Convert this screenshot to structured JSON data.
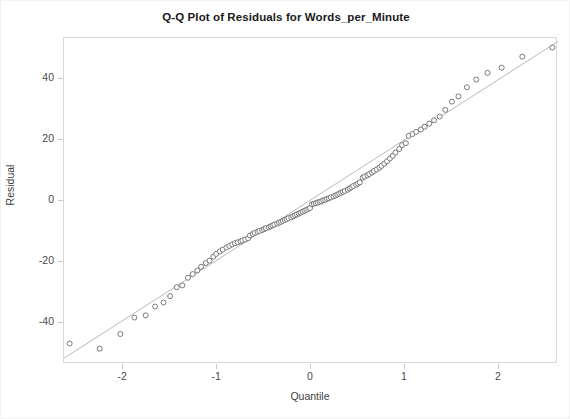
{
  "chart_data": {
    "type": "scatter",
    "title": "Q-Q Plot of Residuals for Words_per_Minute",
    "xlabel": "Quantile",
    "ylabel": "Residual",
    "xlim": [
      -2.63,
      2.63
    ],
    "ylim": [
      -53.3,
      53.3
    ],
    "grid": false,
    "legend": null,
    "xticks": [
      -2,
      -1,
      0,
      1,
      2
    ],
    "xtick_labels": [
      "-2",
      "-1",
      "0",
      "1",
      "2"
    ],
    "yticks": [
      40,
      20,
      0,
      -20,
      -40
    ],
    "ytick_labels": [
      "40",
      "20",
      "0",
      "-20",
      "-40"
    ],
    "marker": "open-circle",
    "marker_color": "#6b6b6b",
    "marker_fill": "#ffffff",
    "marker_size": 5,
    "reference_line": {
      "name": "normal-reference-line",
      "color": "#b0b0b0",
      "slope": 19.7,
      "intercept": 0.4,
      "x_start": -2.63,
      "x_end": 2.63,
      "y_start": -51.4,
      "y_end": 52.2
    },
    "series": [
      {
        "name": "Residual quantiles",
        "x": [
          -2.57,
          -2.25,
          -2.03,
          -1.88,
          -1.76,
          -1.66,
          -1.57,
          -1.5,
          -1.43,
          -1.37,
          -1.31,
          -1.26,
          -1.21,
          -1.17,
          -1.12,
          -1.08,
          -1.04,
          -1.01,
          -0.97,
          -0.94,
          -0.9,
          -0.87,
          -0.84,
          -0.81,
          -0.78,
          -0.75,
          -0.73,
          -0.7,
          -0.67,
          -0.65,
          -0.62,
          -0.6,
          -0.57,
          -0.55,
          -0.52,
          -0.5,
          -0.48,
          -0.45,
          -0.43,
          -0.41,
          -0.39,
          -0.36,
          -0.34,
          -0.32,
          -0.3,
          -0.28,
          -0.26,
          -0.24,
          -0.21,
          -0.19,
          -0.17,
          -0.15,
          -0.13,
          -0.11,
          -0.09,
          -0.07,
          -0.05,
          -0.03,
          -0.01,
          0.01,
          0.03,
          0.05,
          0.07,
          0.09,
          0.11,
          0.13,
          0.15,
          0.17,
          0.19,
          0.21,
          0.24,
          0.26,
          0.28,
          0.3,
          0.32,
          0.34,
          0.36,
          0.39,
          0.41,
          0.43,
          0.45,
          0.48,
          0.5,
          0.52,
          0.55,
          0.57,
          0.6,
          0.62,
          0.65,
          0.67,
          0.7,
          0.73,
          0.75,
          0.78,
          0.81,
          0.84,
          0.87,
          0.9,
          0.94,
          0.97,
          1.01,
          1.04,
          1.08,
          1.12,
          1.17,
          1.21,
          1.26,
          1.31,
          1.37,
          1.43,
          1.5,
          1.57,
          1.66,
          1.76,
          1.88,
          2.03,
          2.25,
          2.57
        ],
        "y": [
          -46.6,
          -48.3,
          -43.5,
          -38.1,
          -37.4,
          -34.5,
          -33.2,
          -31.1,
          -28.2,
          -27.6,
          -25.1,
          -23.9,
          -22.7,
          -21.5,
          -20.3,
          -19.5,
          -18.2,
          -17.3,
          -16.5,
          -15.9,
          -15.2,
          -14.7,
          -14.2,
          -13.8,
          -13.5,
          -13.2,
          -12.9,
          -12.6,
          -12.2,
          -11.3,
          -10.8,
          -10.4,
          -10.1,
          -9.8,
          -9.5,
          -9.2,
          -8.9,
          -8.6,
          -8.3,
          -8.0,
          -7.7,
          -7.4,
          -7.1,
          -6.8,
          -6.5,
          -6.2,
          -5.9,
          -5.6,
          -5.3,
          -5.0,
          -4.7,
          -4.4,
          -4.1,
          -3.8,
          -3.5,
          -3.2,
          -2.9,
          -2.6,
          -2.3,
          -1.1,
          -0.9,
          -0.7,
          -0.5,
          -0.3,
          -0.1,
          0.2,
          0.4,
          0.7,
          0.9,
          1.2,
          1.5,
          1.8,
          2.1,
          2.4,
          2.7,
          3.0,
          3.3,
          3.7,
          4.1,
          4.5,
          4.9,
          5.3,
          5.7,
          6.1,
          7.6,
          8.0,
          8.4,
          8.8,
          9.3,
          9.8,
          10.3,
          10.9,
          11.5,
          12.2,
          13.0,
          13.9,
          14.8,
          15.8,
          17.0,
          18.3,
          18.9,
          21.3,
          21.9,
          22.6,
          23.4,
          24.3,
          25.3,
          26.4,
          27.6,
          29.8,
          32.5,
          34.2,
          37.2,
          39.7,
          41.9,
          43.6,
          47.2,
          50.2
        ]
      }
    ]
  }
}
